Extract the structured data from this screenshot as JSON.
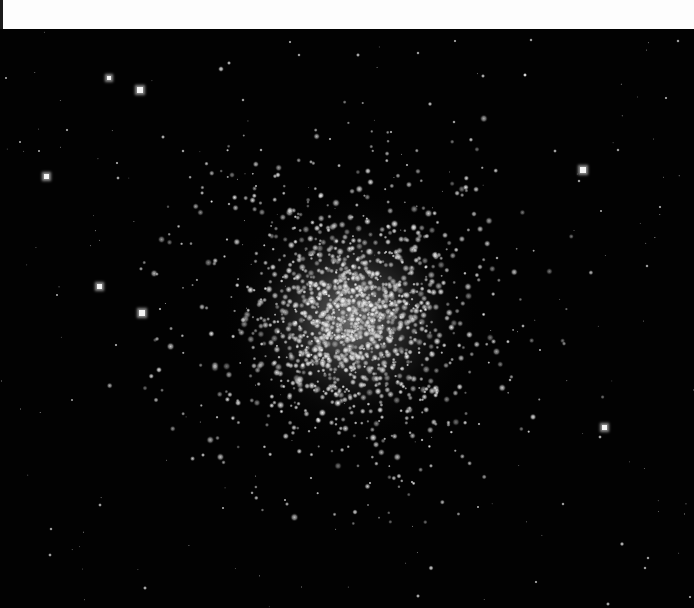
{
  "image": {
    "subject": "globular star cluster on black sky",
    "top_band_color": "#fdfdfd",
    "sky_color": "#020202"
  },
  "cluster": {
    "center_x": 352,
    "center_y": 318,
    "core_radius": 70,
    "halo_radius": 130,
    "core_color": "#d8d8d8",
    "member_count": 1400,
    "seed": 7
  },
  "bright_stars": [
    {
      "x": 140,
      "y": 90,
      "size": 6
    },
    {
      "x": 109,
      "y": 78,
      "size": 4
    },
    {
      "x": 46,
      "y": 176,
      "size": 5
    },
    {
      "x": 99,
      "y": 286,
      "size": 5
    },
    {
      "x": 142,
      "y": 313,
      "size": 6
    },
    {
      "x": 583,
      "y": 170,
      "size": 6
    },
    {
      "x": 604,
      "y": 427,
      "size": 5
    }
  ],
  "field_stars": [
    {
      "x": 221,
      "y": 69,
      "r": 1.8
    },
    {
      "x": 229,
      "y": 63,
      "r": 1.3
    },
    {
      "x": 290,
      "y": 42,
      "r": 1.0
    },
    {
      "x": 299,
      "y": 55,
      "r": 1.1
    },
    {
      "x": 358,
      "y": 55,
      "r": 1.3
    },
    {
      "x": 418,
      "y": 53,
      "r": 1.1
    },
    {
      "x": 455,
      "y": 41,
      "r": 1.0
    },
    {
      "x": 531,
      "y": 40,
      "r": 1.1
    },
    {
      "x": 525,
      "y": 75,
      "r": 1.1
    },
    {
      "x": 483,
      "y": 76,
      "r": 1.3
    },
    {
      "x": 525,
      "y": 75,
      "r": 1.3
    },
    {
      "x": 555,
      "y": 151,
      "r": 1.2
    },
    {
      "x": 163,
      "y": 137,
      "r": 1.3
    },
    {
      "x": 261,
      "y": 150,
      "r": 1.1
    },
    {
      "x": 118,
      "y": 178,
      "r": 1.2
    },
    {
      "x": 67,
      "y": 130,
      "r": 1.0
    },
    {
      "x": 20,
      "y": 142,
      "r": 0.9
    },
    {
      "x": 6,
      "y": 78,
      "r": 0.9
    },
    {
      "x": 39,
      "y": 151,
      "r": 0.9
    },
    {
      "x": 117,
      "y": 163,
      "r": 1.0
    },
    {
      "x": 160,
      "y": 309,
      "r": 1.0
    },
    {
      "x": 116,
      "y": 345,
      "r": 1.0
    },
    {
      "x": 57,
      "y": 295,
      "r": 0.9
    },
    {
      "x": 72,
      "y": 400,
      "r": 0.8
    },
    {
      "x": 100,
      "y": 505,
      "r": 1.2
    },
    {
      "x": 51,
      "y": 529,
      "r": 1.1
    },
    {
      "x": 50,
      "y": 555,
      "r": 1.2
    },
    {
      "x": 145,
      "y": 588,
      "r": 1.3
    },
    {
      "x": 203,
      "y": 455,
      "r": 1.3
    },
    {
      "x": 223,
      "y": 508,
      "r": 0.9
    },
    {
      "x": 431,
      "y": 568,
      "r": 1.6
    },
    {
      "x": 418,
      "y": 596,
      "r": 1.3
    },
    {
      "x": 478,
      "y": 507,
      "r": 0.9
    },
    {
      "x": 536,
      "y": 582,
      "r": 1.0
    },
    {
      "x": 563,
      "y": 504,
      "r": 1.1
    },
    {
      "x": 600,
      "y": 437,
      "r": 1.2
    },
    {
      "x": 622,
      "y": 544,
      "r": 1.4
    },
    {
      "x": 648,
      "y": 558,
      "r": 1.1
    },
    {
      "x": 645,
      "y": 568,
      "r": 1.1
    },
    {
      "x": 608,
      "y": 604,
      "r": 1.3
    },
    {
      "x": 690,
      "y": 597,
      "r": 1.0
    },
    {
      "x": 660,
      "y": 207,
      "r": 1.0
    },
    {
      "x": 647,
      "y": 266,
      "r": 1.1
    },
    {
      "x": 678,
      "y": 41,
      "r": 1.1
    },
    {
      "x": 666,
      "y": 98,
      "r": 1.0
    },
    {
      "x": 618,
      "y": 150,
      "r": 1.1
    },
    {
      "x": 579,
      "y": 181,
      "r": 1.1
    },
    {
      "x": 601,
      "y": 211,
      "r": 0.9
    },
    {
      "x": 523,
      "y": 326,
      "r": 1.2
    },
    {
      "x": 497,
      "y": 258,
      "r": 1.1
    },
    {
      "x": 510,
      "y": 380,
      "r": 1.1
    },
    {
      "x": 540,
      "y": 350,
      "r": 0.9
    },
    {
      "x": 479,
      "y": 424,
      "r": 1.0
    },
    {
      "x": 412,
      "y": 482,
      "r": 1.0
    },
    {
      "x": 370,
      "y": 483,
      "r": 1.0
    },
    {
      "x": 311,
      "y": 478,
      "r": 1.0
    },
    {
      "x": 285,
      "y": 500,
      "r": 0.9
    },
    {
      "x": 407,
      "y": 165,
      "r": 1.0
    },
    {
      "x": 454,
      "y": 122,
      "r": 1.1
    },
    {
      "x": 430,
      "y": 104,
      "r": 1.4
    },
    {
      "x": 391,
      "y": 132,
      "r": 1.0
    },
    {
      "x": 330,
      "y": 139,
      "r": 1.0
    },
    {
      "x": 243,
      "y": 100,
      "r": 1.1
    },
    {
      "x": 183,
      "y": 151,
      "r": 1.1
    },
    {
      "x": 256,
      "y": 186,
      "r": 0.9
    }
  ]
}
